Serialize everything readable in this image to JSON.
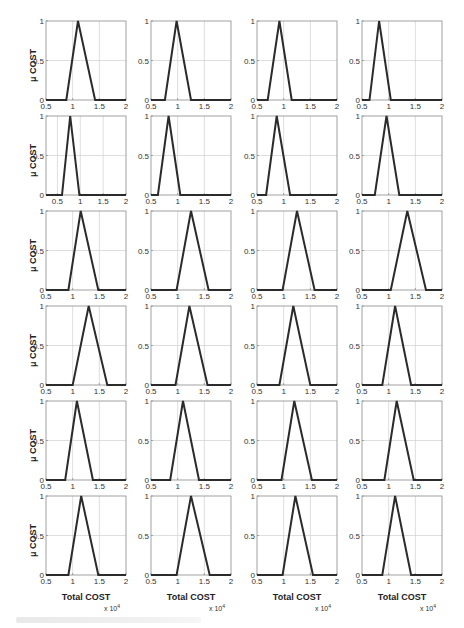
{
  "figure": {
    "rows": 6,
    "cols": 4,
    "y_axis_label": "μ COST",
    "x_axis_label": "Total COST",
    "x_exponent_base": "x 10",
    "x_exponent_power": "4",
    "line_color": "#2b2b2b",
    "grid_color": "#d0d0d0",
    "axes_color": "#8a8a8a",
    "caption_legible": false
  },
  "chart_data": {
    "type": "line",
    "title": "",
    "xlabel": "Total COST (x 10^4)",
    "ylabel": "μ COST",
    "layout": "6 rows x 4 columns of small-multiple triangular membership functions",
    "grid": true,
    "ylim": [
      0,
      1
    ],
    "yticks": [
      "0",
      "0.5",
      "1"
    ],
    "xticks": [
      "0.5",
      "1",
      "1.5",
      "2"
    ],
    "panels": [
      {
        "row": 1,
        "col": 1,
        "xlim": [
          0.5,
          2
        ],
        "triangle": [
          0.88,
          1.1,
          1.42
        ]
      },
      {
        "row": 1,
        "col": 2,
        "xlim": [
          0.5,
          2
        ],
        "triangle": [
          0.76,
          0.98,
          1.25
        ]
      },
      {
        "row": 1,
        "col": 3,
        "xlim": [
          0.5,
          2
        ],
        "triangle": [
          0.7,
          0.92,
          1.15
        ]
      },
      {
        "row": 1,
        "col": 4,
        "xlim": [
          0.5,
          2
        ],
        "triangle": [
          0.64,
          0.82,
          1.04
        ]
      },
      {
        "row": 2,
        "col": 1,
        "xlim": [
          0.25,
          2
        ],
        "triangle": [
          0.6,
          0.78,
          0.98
        ]
      },
      {
        "row": 2,
        "col": 2,
        "xlim": [
          0.5,
          2
        ],
        "triangle": [
          0.63,
          0.83,
          1.05
        ]
      },
      {
        "row": 2,
        "col": 3,
        "xlim": [
          0.5,
          2
        ],
        "triangle": [
          0.67,
          0.87,
          1.12
        ]
      },
      {
        "row": 2,
        "col": 4,
        "xlim": [
          0.5,
          2
        ],
        "triangle": [
          0.74,
          0.96,
          1.2
        ]
      },
      {
        "row": 3,
        "col": 1,
        "xlim": [
          0.5,
          2
        ],
        "triangle": [
          0.92,
          1.15,
          1.48
        ]
      },
      {
        "row": 3,
        "col": 2,
        "xlim": [
          0.5,
          2
        ],
        "triangle": [
          0.98,
          1.25,
          1.58
        ]
      },
      {
        "row": 3,
        "col": 3,
        "xlim": [
          0.5,
          2
        ],
        "triangle": [
          0.98,
          1.25,
          1.58
        ]
      },
      {
        "row": 3,
        "col": 4,
        "xlim": [
          0.5,
          2
        ],
        "triangle": [
          1.04,
          1.35,
          1.7
        ]
      },
      {
        "row": 4,
        "col": 1,
        "xlim": [
          0.5,
          2
        ],
        "triangle": [
          1.0,
          1.3,
          1.65
        ]
      },
      {
        "row": 4,
        "col": 2,
        "xlim": [
          0.5,
          2
        ],
        "triangle": [
          0.96,
          1.22,
          1.56
        ]
      },
      {
        "row": 4,
        "col": 3,
        "xlim": [
          0.5,
          2
        ],
        "triangle": [
          0.92,
          1.18,
          1.5
        ]
      },
      {
        "row": 4,
        "col": 4,
        "xlim": [
          0.5,
          2
        ],
        "triangle": [
          0.88,
          1.12,
          1.42
        ]
      },
      {
        "row": 5,
        "col": 1,
        "xlim": [
          0.5,
          2
        ],
        "triangle": [
          0.86,
          1.08,
          1.38
        ]
      },
      {
        "row": 5,
        "col": 2,
        "xlim": [
          0.5,
          2
        ],
        "triangle": [
          0.86,
          1.1,
          1.4
        ]
      },
      {
        "row": 5,
        "col": 3,
        "xlim": [
          0.5,
          2
        ],
        "triangle": [
          0.96,
          1.2,
          1.53
        ]
      },
      {
        "row": 5,
        "col": 4,
        "xlim": [
          0.5,
          2
        ],
        "triangle": [
          0.92,
          1.15,
          1.47
        ]
      },
      {
        "row": 6,
        "col": 1,
        "xlim": [
          0.5,
          2
        ],
        "triangle": [
          0.92,
          1.16,
          1.48
        ]
      },
      {
        "row": 6,
        "col": 2,
        "xlim": [
          0.5,
          2
        ],
        "triangle": [
          0.98,
          1.25,
          1.6
        ]
      },
      {
        "row": 6,
        "col": 3,
        "xlim": [
          0.5,
          2
        ],
        "triangle": [
          0.98,
          1.22,
          1.55
        ]
      },
      {
        "row": 6,
        "col": 4,
        "xlim": [
          0.5,
          2
        ],
        "triangle": [
          0.88,
          1.12,
          1.42
        ]
      }
    ]
  }
}
